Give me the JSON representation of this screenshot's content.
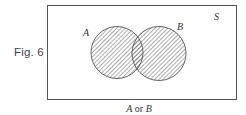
{
  "figure": {
    "label": "Fig. 6",
    "universe_label": "S",
    "caption": {
      "set_a": "A",
      "connector": "or",
      "set_b": "B"
    },
    "sets": [
      {
        "name": "A",
        "shaded": true
      },
      {
        "name": "B",
        "shaded": true
      }
    ],
    "shaded_region": "A or B",
    "colors": {
      "stroke": "#555555",
      "hatch": "#666666",
      "background": "#ffffff"
    }
  }
}
